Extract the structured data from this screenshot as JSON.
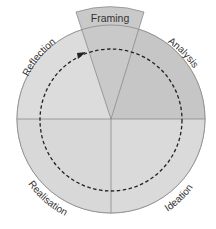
{
  "diagram": {
    "type": "cycle",
    "segments": [
      {
        "id": "framing",
        "label": "Framing",
        "position": "top"
      },
      {
        "id": "analysis",
        "label": "Analysis",
        "position": "upper-right"
      },
      {
        "id": "ideation",
        "label": "Ideation",
        "position": "lower-right"
      },
      {
        "id": "realisation",
        "label": "Realisation",
        "position": "lower-left"
      },
      {
        "id": "reflection",
        "label": "Reflection",
        "position": "upper-left"
      }
    ],
    "flow_direction": "clockwise",
    "colors": {
      "background": "#ffffff",
      "circle_fill": "#d9d9d9",
      "analysis_fill": "#c4c4c4",
      "framing_fill": "#c8c8c8",
      "stroke": "#8a8a8a",
      "dashed_path": "#222222",
      "text": "#333333"
    }
  }
}
